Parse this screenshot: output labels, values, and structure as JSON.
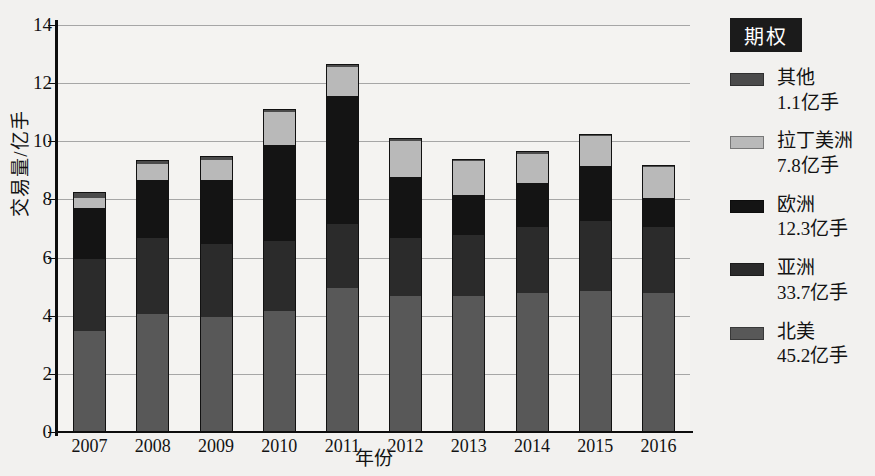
{
  "chart_data": {
    "type": "bar",
    "stacked": true,
    "title": "",
    "xlabel": "年份",
    "ylabel": "交易量/亿手",
    "categories": [
      "2007",
      "2008",
      "2009",
      "2010",
      "2011",
      "2012",
      "2013",
      "2014",
      "2015",
      "2016"
    ],
    "ylim": [
      0,
      14
    ],
    "yticks": [
      0,
      2,
      4,
      6,
      8,
      10,
      12,
      14
    ],
    "grid": true,
    "legend_position": "right",
    "legend_title": "期权",
    "series": [
      {
        "name": "北美",
        "total_label": "45.2亿手",
        "color": "#585858",
        "values": [
          3.5,
          4.1,
          4.0,
          4.2,
          5.0,
          4.7,
          4.7,
          4.8,
          4.9,
          4.8
        ]
      },
      {
        "name": "亚洲",
        "total_label": "33.7亿手",
        "color": "#2b2b2b",
        "values": [
          2.5,
          2.6,
          2.5,
          2.4,
          2.2,
          2.0,
          2.1,
          2.3,
          2.4,
          2.3
        ]
      },
      {
        "name": "欧洲",
        "total_label": "12.3亿手",
        "color": "#141414",
        "values": [
          1.75,
          2.0,
          2.2,
          3.3,
          4.4,
          2.1,
          1.4,
          1.5,
          1.9,
          1.0
        ]
      },
      {
        "name": "拉丁美洲",
        "total_label": "7.8亿手",
        "color": "#b9b9b9",
        "values": [
          0.35,
          0.55,
          0.7,
          1.15,
          1.0,
          1.25,
          1.15,
          1.0,
          1.0,
          1.05
        ]
      },
      {
        "name": "其他",
        "total_label": "1.1亿手",
        "color": "#4b4b4b",
        "values": [
          0.15,
          0.1,
          0.1,
          0.05,
          0.05,
          0.05,
          0.05,
          0.05,
          0.05,
          0.05
        ]
      }
    ],
    "totals": [
      8.25,
      9.35,
      9.5,
      11.1,
      12.65,
      10.1,
      9.4,
      9.65,
      10.25,
      9.2
    ]
  }
}
